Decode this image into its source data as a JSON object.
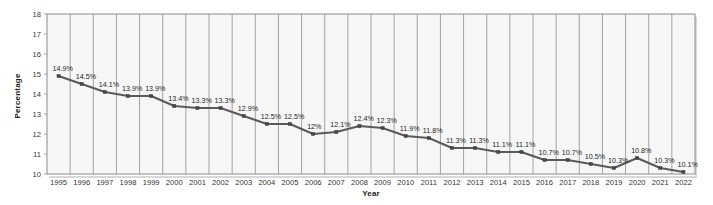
{
  "chart_data": {
    "type": "line",
    "title": "",
    "xlabel": "Year",
    "ylabel": "Percentage",
    "categories": [
      "1995",
      "1996",
      "1997",
      "1998",
      "1999",
      "2000",
      "2001",
      "2002",
      "2003",
      "2004",
      "2005",
      "2006",
      "2007",
      "2008",
      "2009",
      "2010",
      "2011",
      "2012",
      "2013",
      "2014",
      "2015",
      "2016",
      "2017",
      "2018",
      "2019",
      "2020",
      "2021",
      "2022"
    ],
    "values": [
      14.9,
      14.5,
      14.1,
      13.9,
      13.9,
      13.4,
      13.3,
      13.3,
      12.9,
      12.5,
      12.5,
      12.0,
      12.1,
      12.4,
      12.3,
      11.9,
      11.8,
      11.3,
      11.3,
      11.1,
      11.1,
      10.7,
      10.7,
      10.5,
      10.3,
      10.8,
      10.3,
      10.1
    ],
    "point_labels": [
      "14.9%",
      "14.5%",
      "14.1%",
      "13.9%",
      "13.9%",
      "13.4%",
      "13.3%",
      "13.3%",
      "12.9%",
      "12.5%",
      "12.5%",
      "12%",
      "12.1%",
      "12.4%",
      "12.3%",
      "11.9%",
      "11.8%",
      "11.3%",
      "11.3%",
      "11.1%",
      "11.1%",
      "10.7%",
      "10.7%",
      "10.5%",
      "10.3%",
      "10.8%",
      "10.3%",
      "10.1%"
    ],
    "ylim": [
      10,
      18
    ],
    "yticks": [
      10,
      11,
      12,
      13,
      14,
      15,
      16,
      17,
      18
    ],
    "ytick_labels": [
      "10",
      "11",
      "12",
      "13",
      "14",
      "15",
      "16",
      "17",
      "18"
    ],
    "grid": "vertical-only",
    "legend": "none",
    "series": [
      {
        "name": "Percentage",
        "values": [
          14.9,
          14.5,
          14.1,
          13.9,
          13.9,
          13.4,
          13.3,
          13.3,
          12.9,
          12.5,
          12.5,
          12.0,
          12.1,
          12.4,
          12.3,
          11.9,
          11.8,
          11.3,
          11.3,
          11.1,
          11.1,
          10.7,
          10.7,
          10.5,
          10.3,
          10.8,
          10.3,
          10.1
        ],
        "color": "#5a5a5a",
        "marker": "square"
      }
    ],
    "colors": {
      "line": "#5a5a5a",
      "marker": "#4a4a4a",
      "plot_background": "#f6f6f6",
      "grid": "#9a9a9a",
      "border": "#8c8c8c",
      "text": "#1f1f1f",
      "page_background": "#ffffff"
    }
  }
}
